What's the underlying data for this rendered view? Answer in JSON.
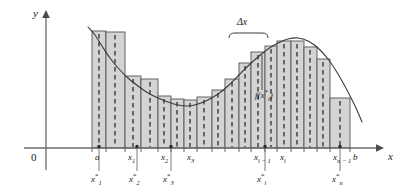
{
  "figure": {
    "type": "riemann-sum-diagram",
    "axes": {
      "y_label": "y",
      "x_label": "x",
      "origin_label": "0"
    },
    "annotations": {
      "delta_x": "Δx",
      "function_value": "f(x",
      "function_value_star": "*",
      "function_value_sub": "i",
      "function_value_close": ")"
    },
    "x_ticks": [
      {
        "label": "a",
        "sub": "",
        "x": 92
      },
      {
        "label": "x",
        "sub": "1",
        "x": 125
      },
      {
        "label": "x",
        "sub": "2",
        "x": 158
      },
      {
        "label": "x",
        "sub": "3",
        "x": 184
      },
      {
        "label": "x",
        "sub": "i − 1",
        "x": 251
      },
      {
        "label": "x",
        "sub": "i",
        "x": 277
      },
      {
        "label": "x",
        "sub": "n − 1",
        "x": 330
      },
      {
        "label": "b",
        "sub": "",
        "x": 350
      }
    ],
    "sample_points": [
      {
        "label": "x",
        "sub": "1",
        "star": "*",
        "x": 99
      },
      {
        "label": "x",
        "sub": "2",
        "star": "*",
        "x": 137
      },
      {
        "label": "x",
        "sub": "3",
        "star": "*",
        "x": 171
      },
      {
        "label": "x",
        "sub": "i",
        "star": "*",
        "x": 265
      },
      {
        "label": "x",
        "sub": "n",
        "star": "*",
        "x": 340
      }
    ],
    "colors": {
      "bar_fill": "#d4d4d4",
      "bar_stroke": "#555555",
      "curve": "#3a3a3a",
      "axis": "#6b6b6b",
      "dashed": "#3a3a3a",
      "text": "#1a1a1a"
    }
  },
  "chart_data": {
    "type": "bar",
    "title": "",
    "xlabel": "x",
    "ylabel": "y",
    "grid": false,
    "legend": null,
    "baseline_y": 148,
    "x_axis_pixel_range": [
      46,
      378
    ],
    "partition_points": [
      92,
      106,
      125,
      141,
      158,
      171,
      184,
      197,
      212,
      225,
      239,
      251,
      265,
      277,
      291,
      304,
      317,
      330,
      350
    ],
    "bars": [
      {
        "x0": 92,
        "x1": 106,
        "top": 31,
        "height": 117,
        "sample_x": 99
      },
      {
        "x0": 106,
        "x1": 125,
        "top": 32,
        "height": 116,
        "sample_x": 115
      },
      {
        "x0": 125,
        "x1": 141,
        "top": 76,
        "height": 72,
        "sample_x": 133
      },
      {
        "x0": 141,
        "x1": 158,
        "top": 79,
        "height": 69,
        "sample_x": 150
      },
      {
        "x0": 158,
        "x1": 171,
        "top": 96,
        "height": 52,
        "sample_x": 164
      },
      {
        "x0": 171,
        "x1": 184,
        "top": 99,
        "height": 49,
        "sample_x": 177
      },
      {
        "x0": 184,
        "x1": 197,
        "top": 100,
        "height": 48,
        "sample_x": 190
      },
      {
        "x0": 197,
        "x1": 212,
        "top": 97,
        "height": 51,
        "sample_x": 204
      },
      {
        "x0": 212,
        "x1": 225,
        "top": 90,
        "height": 58,
        "sample_x": 218
      },
      {
        "x0": 225,
        "x1": 239,
        "top": 79,
        "height": 69,
        "sample_x": 232
      },
      {
        "x0": 239,
        "x1": 251,
        "top": 63,
        "height": 85,
        "sample_x": 245
      },
      {
        "x0": 251,
        "x1": 265,
        "top": 52,
        "height": 96,
        "sample_x": 258
      },
      {
        "x0": 265,
        "x1": 277,
        "top": 46,
        "height": 102,
        "sample_x": 271
      },
      {
        "x0": 277,
        "x1": 291,
        "top": 41,
        "height": 107,
        "sample_x": 284
      },
      {
        "x0": 291,
        "x1": 304,
        "top": 41,
        "height": 107,
        "sample_x": 297
      },
      {
        "x0": 304,
        "x1": 317,
        "top": 47,
        "height": 101,
        "sample_x": 310
      },
      {
        "x0": 317,
        "x1": 330,
        "top": 59,
        "height": 89,
        "sample_x": 323
      },
      {
        "x0": 330,
        "x1": 350,
        "top": 98,
        "height": 50,
        "sample_x": 340
      }
    ],
    "curve_points": [
      [
        88,
        27
      ],
      [
        95,
        35
      ],
      [
        102,
        46
      ],
      [
        110,
        58
      ],
      [
        119,
        69
      ],
      [
        128,
        78
      ],
      [
        138,
        86
      ],
      [
        148,
        93
      ],
      [
        158,
        98
      ],
      [
        168,
        102
      ],
      [
        178,
        105
      ],
      [
        188,
        106
      ],
      [
        198,
        104
      ],
      [
        208,
        100
      ],
      [
        218,
        94
      ],
      [
        228,
        86
      ],
      [
        238,
        76
      ],
      [
        248,
        66
      ],
      [
        258,
        57
      ],
      [
        268,
        49
      ],
      [
        278,
        43
      ],
      [
        288,
        39
      ],
      [
        298,
        38
      ],
      [
        308,
        41
      ],
      [
        318,
        48
      ],
      [
        328,
        59
      ],
      [
        338,
        74
      ],
      [
        348,
        92
      ],
      [
        356,
        108
      ],
      [
        362,
        122
      ]
    ],
    "delta_x_bracket": {
      "x0": 229,
      "x1": 268,
      "y": 33,
      "label": "Δx"
    }
  }
}
